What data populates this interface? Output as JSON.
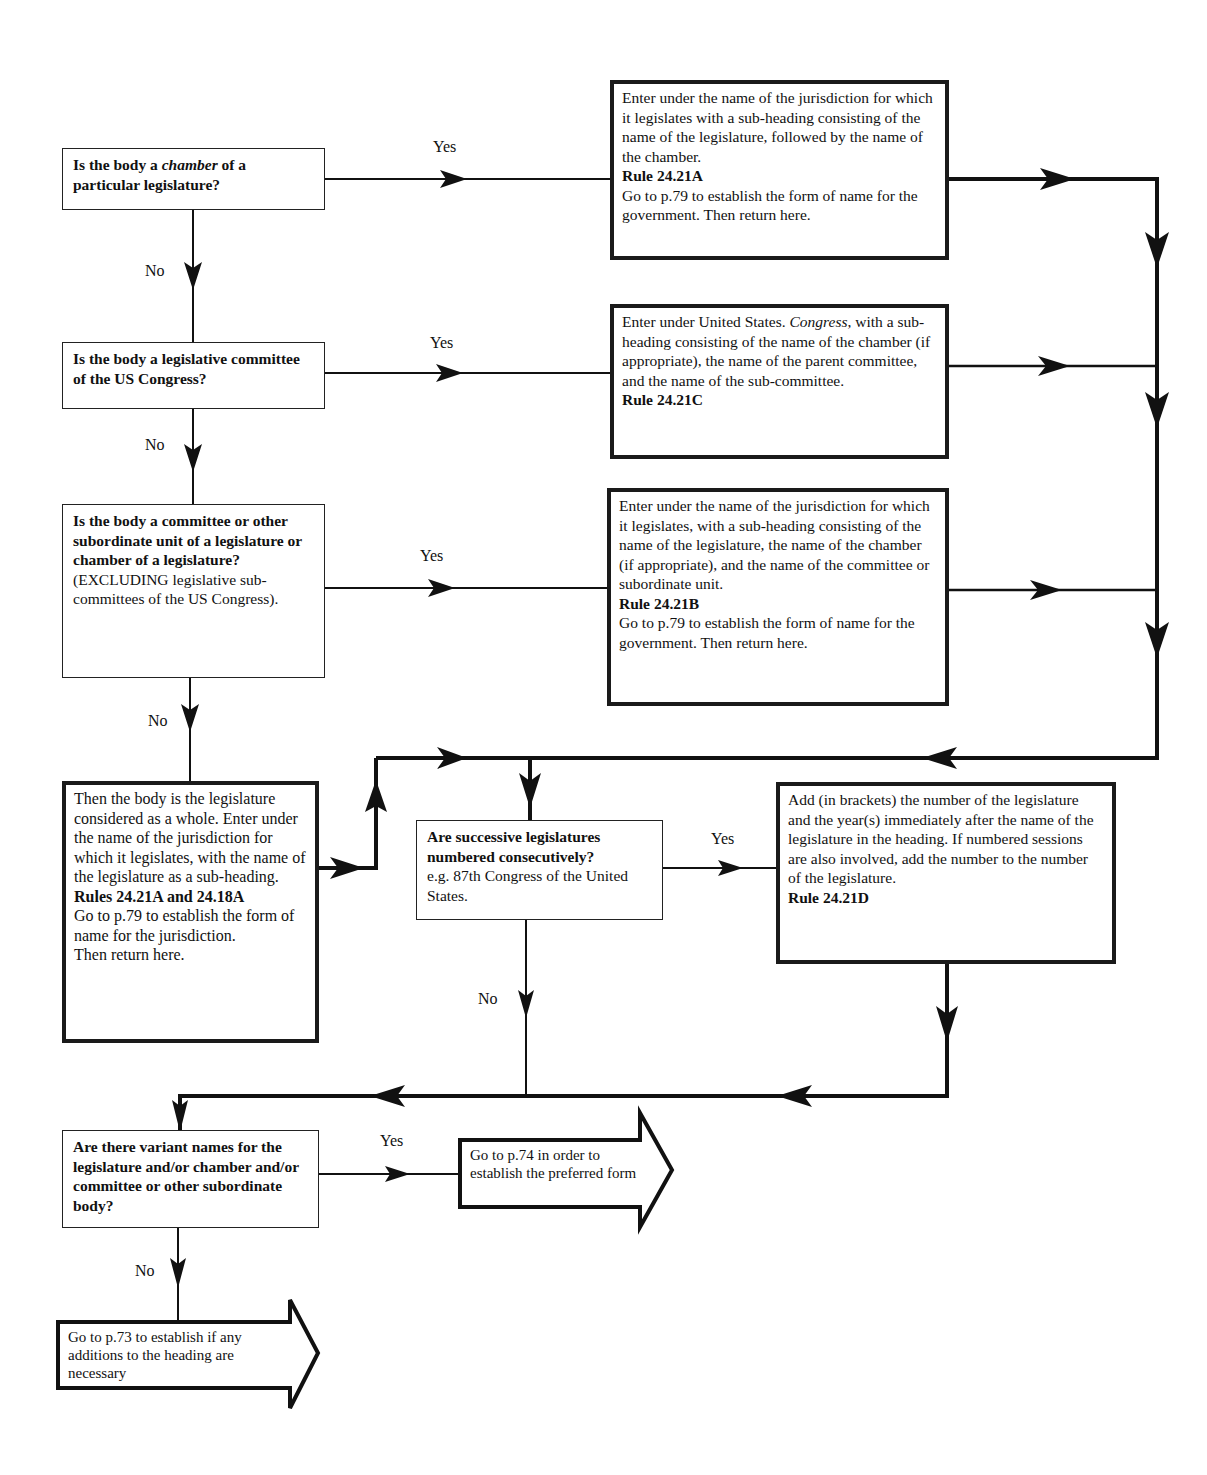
{
  "flowchart": {
    "q1": {
      "parts": [
        "Is the body a ",
        "chamber",
        " of a particular legislature?"
      ]
    },
    "a1": {
      "text": "Enter under the name of the jurisdiction for which it legislates with a sub-heading consisting of the name of the legislature, followed by the name of the chamber.",
      "rule": "Rule 24.21A",
      "goto": "Go to p.79 to establish the form of name for the government. Then return here."
    },
    "q2": {
      "text": "Is the body a legislative committee of the US Congress?"
    },
    "a2": {
      "prefix": "Enter under United States. ",
      "italic": "Congress",
      "text": ", with a sub-heading consisting of the name of the chamber (if appropriate), the name of the parent committee, and the name of the sub-committee.",
      "rule": "Rule 24.21C"
    },
    "q3": {
      "text": "Is the body a committee or other subordinate unit of a legislature or chamber of a legislature?",
      "note": "(EXCLUDING legislative sub-committees of the US Congress)."
    },
    "a3": {
      "text": "Enter under the name of the jurisdiction for which it legislates, with a sub-heading consisting of the name of the legislature, the name of the chamber (if appropriate), and the name of the committee or subordinate unit.",
      "rule": "Rule 24.21B",
      "goto": "Go to p.79 to establish the form of name for the government. Then return here."
    },
    "a4": {
      "text": "Then the body is the legislature considered as a whole. Enter under the name of the jurisdiction for which it legislates, with the name of the legislature as a sub-heading.",
      "rule": "Rules 24.21A and 24.18A",
      "goto": "Go to p.79 to establish the form of name for the jurisdiction.",
      "return": "Then return here."
    },
    "q5": {
      "text": "Are successive legislatures numbered consecutively?",
      "note": "e.g. 87th Congress of the United States."
    },
    "a5": {
      "text": "Add (in brackets) the number of the legislature and the year(s) immediately after the name of the legislature in the heading. If numbered sessions are also involved, add the number to the number of the legislature.",
      "rule": "Rule 24.21D"
    },
    "q6": {
      "text": "Are there variant names for the legislature and/or chamber and/or committee or other subordinate body?"
    },
    "exit_yes": {
      "text": "Go to p.74 in order to establish the preferred form"
    },
    "exit_no": {
      "text": "Go to p.73 to establish if any additions to the heading are necessary"
    },
    "labels": {
      "yes": "Yes",
      "no": "No"
    }
  }
}
